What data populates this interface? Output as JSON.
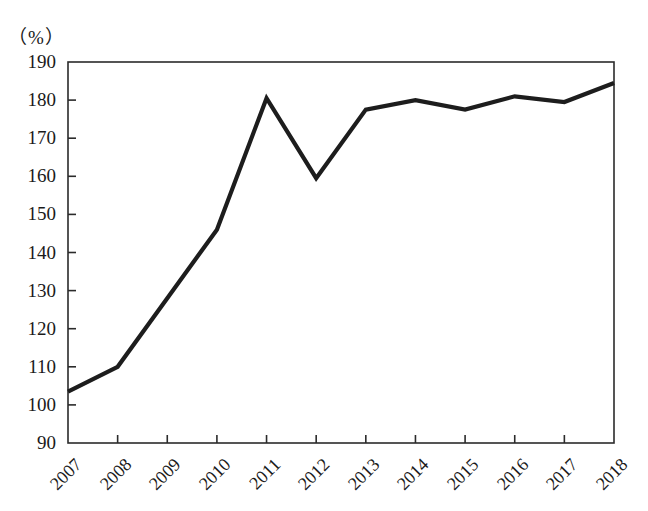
{
  "chart_data": {
    "type": "line",
    "title": "",
    "subtitle": "",
    "xlabel": "",
    "ylabel": "",
    "unit_label": "（%）",
    "categories": [
      "2007",
      "2008",
      "2009",
      "2010",
      "2011",
      "2012",
      "2013",
      "2014",
      "2015",
      "2016",
      "2017",
      "2018"
    ],
    "series": [
      {
        "name": "",
        "values": [
          103.5,
          110.0,
          128.0,
          146.0,
          180.5,
          159.5,
          177.5,
          180.0,
          177.5,
          181.0,
          179.5,
          184.5
        ]
      }
    ],
    "ylim": [
      90,
      190
    ],
    "yticks": [
      90,
      100,
      110,
      120,
      130,
      140,
      150,
      160,
      170,
      180,
      190
    ],
    "ytick_labels": [
      "90",
      "100",
      "110",
      "120",
      "130",
      "140",
      "150",
      "160",
      "170",
      "180",
      "190"
    ],
    "xtick_labels": [
      "2007",
      "2008",
      "2009",
      "2010",
      "2011",
      "2012",
      "2013",
      "2014",
      "2015",
      "2016",
      "2017",
      "2018"
    ],
    "xtick_rotation_deg": -45,
    "grid": false,
    "legend": "none",
    "line_color": "#1d1d1d",
    "axis_color": "#2b2b2b",
    "background_color": "#ffffff"
  }
}
